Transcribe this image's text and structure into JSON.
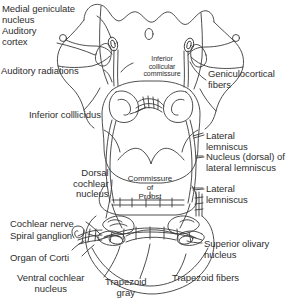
{
  "figure": {
    "background_color": "#ffffff",
    "line_color": "#3a3a3a",
    "text_color": "#2e2e2e"
  },
  "labels": {
    "medial_geniculate_nucleus": "Medial geniculate\nnucleus",
    "auditory_cortex": "Auditory\ncortex",
    "auditory_radiations": "Auditory radiations",
    "inferior_colliculus": "Inferior colllicidus",
    "inferior_collicular_commissure": "Inferior\ncollicular\ncommissure",
    "geniculocortical_fibers": "Geniculocortical\nfibers",
    "lateral_lemniscus_upper": "Lateral\nlemniscus",
    "nucleus_dorsal_of_lateral_lemniscus": "Nucleus (dorsal) of\nlateral lemniscus",
    "lateral_lemniscus_lower": "Lateral\nlemniscus",
    "commissure_of_probst": "Commissure\nof\nProbst",
    "dorsal_cochlear_nucleus": "Dorsal\ncochlear\nnucleus",
    "cochlear_nerve": "Cochlear nerve",
    "spiral_ganglion": "Spiral ganglion",
    "organ_of_corti": "Organ of Corti",
    "ventral_cochlear_nucleus": "Ventral cochlear\nnucleus",
    "superior_olivary_nucleus": "Superior olivary\nnucleus",
    "trapezoid_fibers": "Trapezoid fibers",
    "trapezoid_gray": "Trapezoid\ngray"
  }
}
